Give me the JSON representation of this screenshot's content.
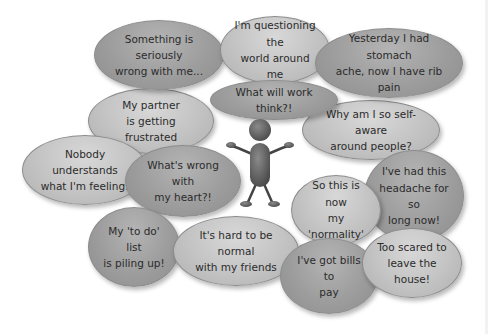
{
  "diagram": {
    "type": "thought-bubble-cluster",
    "center_figure": "stick-person-shrugging",
    "colors": {
      "background": "#ffffff",
      "bubble_dark": "#9d9d9d",
      "bubble_light": "#c3c3c3",
      "text": "#2b2b2b",
      "figure": "#5a5a5a"
    },
    "bubbles": [
      {
        "text": "Something is seriously\nwrong with me...",
        "tone": "dark"
      },
      {
        "text": "I'm questioning the\nworld around me",
        "tone": "light"
      },
      {
        "text": "Yesterday I had stomach\nache, now I have rib pain",
        "tone": "dark"
      },
      {
        "text": "What will work think?!",
        "tone": "dark"
      },
      {
        "text": "My partner\nis getting frustrated",
        "tone": "light"
      },
      {
        "text": "Why am I so self-aware\naround people?",
        "tone": "light"
      },
      {
        "text": "Nobody understands\nwhat I'm feeling!",
        "tone": "light"
      },
      {
        "text": "What's wrong with\nmy heart?!",
        "tone": "dark"
      },
      {
        "text": "I've had this\nheadache for so\nlong now!",
        "tone": "dark"
      },
      {
        "text": "So this is now\nmy 'normality'",
        "tone": "light"
      },
      {
        "text": "My 'to do' list\nis piling up!",
        "tone": "dark"
      },
      {
        "text": "It's hard to be normal\nwith my friends",
        "tone": "light"
      },
      {
        "text": "I've got bills to\npay",
        "tone": "dark"
      },
      {
        "text": "Too scared to\nleave the house!",
        "tone": "light"
      }
    ]
  }
}
